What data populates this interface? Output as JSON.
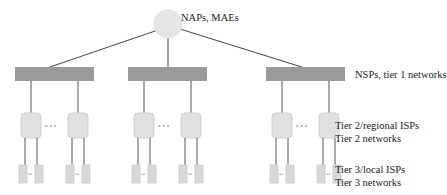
{
  "diagram": {
    "top": {
      "label": "NAPs, MAEs",
      "fill": "#e6e6e6"
    },
    "tier1": {
      "label": "NSPs, tier 1 networks",
      "fill": "#9a9a9a",
      "count": 3
    },
    "tier2": {
      "label_line1": "Tier 2/regional ISPs",
      "label_line2": "Tier 2 networks",
      "fill": "#e0e0e0",
      "ellipsis": "• • •"
    },
    "tier3": {
      "label_line1": "Tier 3/local ISPs",
      "label_line2": "Tier 3 networks",
      "fill": "#d8d8d8",
      "ellipsis": "••"
    }
  }
}
